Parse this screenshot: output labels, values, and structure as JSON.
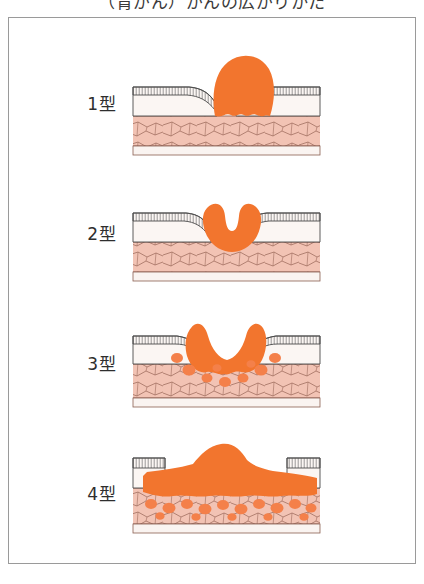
{
  "caption": {
    "text": "（胃がん）がんの広がりかた"
  },
  "figure": {
    "orientation": "cross-section",
    "rows": [
      {
        "label": "1型",
        "type_name": "隆起型",
        "name": "polypoid-protruding-mass",
        "description": "粘膜面から大きく隆起する腫瘤。基部はくびれ、粘膜層にとどまる。",
        "tumor_shape": "dome",
        "invasion_depth": "mucosa",
        "has_tumor_nests": false
      },
      {
        "label": "2型",
        "type_name": "潰瘍限局型",
        "name": "ulcerated-localized-crater",
        "description": "周堤を伴う限局性潰瘍。中央が陥凹し辺縁が盛り上がる。",
        "tumor_shape": "crater",
        "invasion_depth": "submucosa",
        "has_tumor_nests": false
      },
      {
        "label": "3型",
        "type_name": "潰瘍浸潤型",
        "name": "ulcerated-infiltrative",
        "description": "潰瘍の周囲に境界不明瞭な浸潤が広がり、深層に腫瘍胞巣が散在する。",
        "tumor_shape": "crater-infiltrating",
        "invasion_depth": "muscularis",
        "has_tumor_nests": true
      },
      {
        "label": "4型",
        "type_name": "びまん浸潤型",
        "name": "diffuse-infiltrating-linitis-plastica",
        "description": "壁全層にびまん性に浸潤し、広範囲に腫瘍胞巣が散在する。",
        "tumor_shape": "diffuse-broad",
        "invasion_depth": "subserosa",
        "has_tumor_nests": true
      }
    ],
    "layers": [
      {
        "name": "mucosa",
        "label": "粘膜",
        "render": "vertical-gland-hatching"
      },
      {
        "name": "submucosa",
        "label": "粘膜下層",
        "render": "pale-fibrous"
      },
      {
        "name": "muscularis-propria",
        "label": "固有筋層",
        "render": "pink-cracked-texture"
      },
      {
        "name": "serosa",
        "label": "漿膜",
        "render": "thin-band"
      }
    ]
  },
  "colors": {
    "tumor": "#F2752E",
    "tumor_light": "#F79356",
    "tumor_nest": "#F4804A",
    "muscularis": "#F2C3B4",
    "muscularis_line": "#9C6A5B",
    "submucosa": "#FBF6F3",
    "mucosa_hatch": "#6E6E6E",
    "outline": "#4A4A4A",
    "serosa": "#FAF4F1",
    "frame_border": "#9A9A9A",
    "background": "#FFFFFF",
    "text": "#2E2E2E"
  }
}
